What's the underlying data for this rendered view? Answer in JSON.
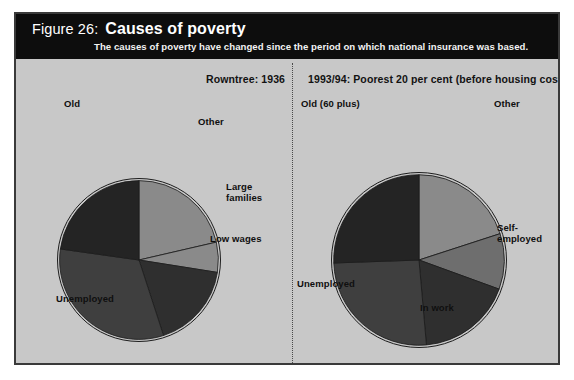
{
  "figure": {
    "number_label": "Figure 26:",
    "title": "Causes of poverty",
    "subtitle": "The causes of poverty have changed since the period on which national insurance was based."
  },
  "panel": {
    "background_color": "#c8c8c8",
    "header_color": "#0d0d0d",
    "border_color": "#3a3a3a"
  },
  "left_chart": {
    "title": "Rowntree: 1936",
    "labels": {
      "old": "Old",
      "other": "Other",
      "large_families": "Large\nfamilies",
      "large_families_line1": "Large",
      "large_families_line2": "families",
      "low_wages": "Low wages",
      "unemployed": "Unemployed"
    }
  },
  "right_chart": {
    "title": "1993/94: Poorest 20 per cent (before housing costs)",
    "labels": {
      "old": "Old (60 plus)",
      "other": "Other",
      "self_employed_line1": "Self-",
      "self_employed_line2": "employed",
      "in_work": "In work",
      "unemployed": "Unemployed"
    }
  },
  "chart_data": [
    {
      "type": "pie",
      "id": "rowntree-1936",
      "title": "Rowntree: 1936",
      "categories": [
        "Other",
        "Large families",
        "Low wages",
        "Unemployed",
        "Old"
      ],
      "values": [
        21.5,
        6.0,
        17.5,
        32.0,
        23.0
      ],
      "units": "per cent",
      "start_angle_deg": 0,
      "direction": "clockwise",
      "colors": [
        "#8a8a8a",
        "#8a8a8a",
        "#2f2f2f",
        "#3f3f3f",
        "#242424"
      ],
      "slice_angles_deg": [
        77,
        22,
        63,
        116,
        82
      ],
      "legend": "none",
      "labels_position": "outside",
      "xlabel": "",
      "ylabel": ""
    },
    {
      "type": "pie",
      "id": "poorest-20-1993-94",
      "title": "1993/94: Poorest 20 per cent (before housing costs)",
      "categories": [
        "Other",
        "Self-employed",
        "In work",
        "Unemployed",
        "Old (60 plus)"
      ],
      "values": [
        20.0,
        10.5,
        18.0,
        26.0,
        25.5
      ],
      "units": "per cent",
      "start_angle_deg": 0,
      "direction": "clockwise",
      "colors": [
        "#8a8a8a",
        "#6e6e6e",
        "#2f2f2f",
        "#3f3f3f",
        "#242424"
      ],
      "slice_angles_deg": [
        72,
        38,
        65,
        93,
        92
      ],
      "legend": "none",
      "labels_position": "outside",
      "xlabel": "",
      "ylabel": ""
    }
  ]
}
